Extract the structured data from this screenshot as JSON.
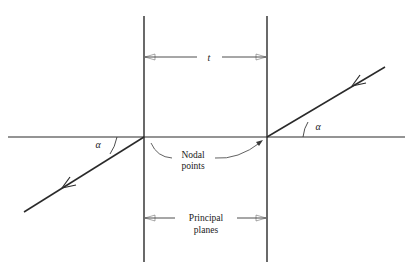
{
  "figure": {
    "type": "optical-ray-diagram",
    "title_visible": false,
    "background_color": "#ffffff",
    "line_color": "#2a2a2a",
    "text_color": "#1a1a1a",
    "width": 413,
    "height": 276
  },
  "labels": {
    "thickness": "t",
    "nodal_points_line1": "Nodal",
    "nodal_points_line2": "points",
    "principal_planes_line1": "Principal",
    "principal_planes_line2": "planes",
    "angle_left": "α",
    "angle_right": "α"
  },
  "geometry": {
    "optical_axis": {
      "x1": 8,
      "y1": 137,
      "x2": 405,
      "y2": 137
    },
    "principal_plane_left": {
      "x": 144,
      "y1": 16,
      "y2": 262
    },
    "principal_plane_right": {
      "x": 267,
      "y1": 16,
      "y2": 262
    },
    "nodal_point_left": {
      "x": 144,
      "y": 137
    },
    "nodal_point_right": {
      "x": 267,
      "y": 137
    },
    "ray_incoming": {
      "x1": 385,
      "y1": 67,
      "x2": 267,
      "y2": 137
    },
    "ray_outgoing": {
      "x1": 144,
      "y1": 137,
      "x2": 24,
      "y2": 212
    },
    "thickness_dimension_y": 57,
    "principal_dimension_y": 218
  },
  "annotations": {
    "arrow_incoming_direction": "down-left",
    "arrow_outgoing_direction": "down-left",
    "angle_arc_left_description": "arc between optical axis and outgoing ray at left nodal point",
    "angle_arc_right_description": "arc between optical axis and incoming ray at right nodal point"
  }
}
